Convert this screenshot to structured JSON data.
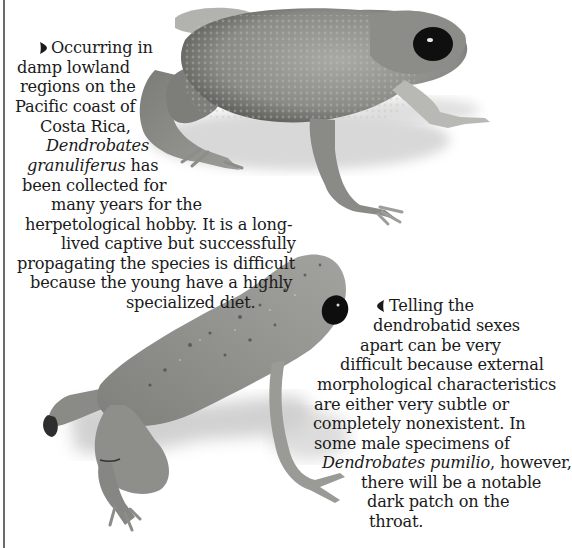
{
  "page": {
    "background": "#ffffff",
    "rule_color": "#6a6a6a"
  },
  "caption_top": {
    "bullet_icon": "right-pointing-bullet",
    "lines": [
      {
        "text": "Occurring in",
        "x": 43,
        "y": 38
      },
      {
        "text": "damp lowland",
        "x": 17,
        "y": 58
      },
      {
        "text": "regions on the",
        "x": 20,
        "y": 77
      },
      {
        "text": "Pacific coast of",
        "x": 15,
        "y": 97
      },
      {
        "text": "Costa Rica,",
        "x": 40,
        "y": 117
      },
      {
        "italic": "Dendrobates",
        "x": 46,
        "y": 136
      },
      {
        "italic": "granuliferus",
        "text_after": " has",
        "x": 27,
        "y": 156
      },
      {
        "text": "been collected for",
        "x": 22,
        "y": 176
      },
      {
        "text": "many years for the",
        "x": 51,
        "y": 195
      },
      {
        "text": "herpetological hobby. It is a long-",
        "x": 25,
        "y": 215
      },
      {
        "text": "lived captive but successfully",
        "x": 61,
        "y": 234
      },
      {
        "text": "propagating the species is difficult",
        "x": 17,
        "y": 254
      },
      {
        "text": "because the young have a highly",
        "x": 30,
        "y": 273
      },
      {
        "text": "specialized diet.",
        "x": 126,
        "y": 293
      }
    ],
    "full_text": "Occurring in damp lowland regions on the Pacific coast of Costa Rica, Dendrobates granuliferus has been collected for many years for the herpetological hobby. It is a long-lived captive but successfully propagating the species is difficult because the young have a highly specialized diet."
  },
  "caption_bottom": {
    "bullet_icon": "left-pointing-bullet",
    "lines": [
      {
        "text": "Telling the",
        "x": 381,
        "y": 296
      },
      {
        "text": "dendrobatid sexes",
        "x": 373,
        "y": 316
      },
      {
        "text": "apart can be very",
        "x": 360,
        "y": 336
      },
      {
        "text": "difficult because external",
        "x": 340,
        "y": 355
      },
      {
        "text": "morphological characteristics",
        "x": 317,
        "y": 375
      },
      {
        "text": "are either very subtle or",
        "x": 314,
        "y": 395
      },
      {
        "text": "completely nonexistent. In",
        "x": 313,
        "y": 414
      },
      {
        "text": "some male specimens of",
        "x": 314,
        "y": 434
      },
      {
        "italic": "Dendrobates pumilio",
        "text_after": ", however,",
        "x": 322,
        "y": 453
      },
      {
        "text": "there will be a notable",
        "x": 361,
        "y": 473
      },
      {
        "text": "dark patch on the",
        "x": 367,
        "y": 492
      },
      {
        "text": "throat.",
        "x": 369,
        "y": 512
      }
    ],
    "full_text": "Telling the dendrobatid sexes apart can be very difficult because external morphological characteristics are either very subtle or completely nonexistent. In some male specimens of Dendrobates pumilio, however, there will be a notable dark patch on the throat."
  },
  "images": {
    "top_frog": {
      "subject": "Dendrobates granuliferus frog photograph",
      "body_color": "#8a8a86",
      "eye_color": "#111111"
    },
    "bottom_frog": {
      "subject": "Dendrobates pumilio frog photograph",
      "body_color": "#8f8f8c",
      "eye_color": "#0e0e0e"
    }
  }
}
